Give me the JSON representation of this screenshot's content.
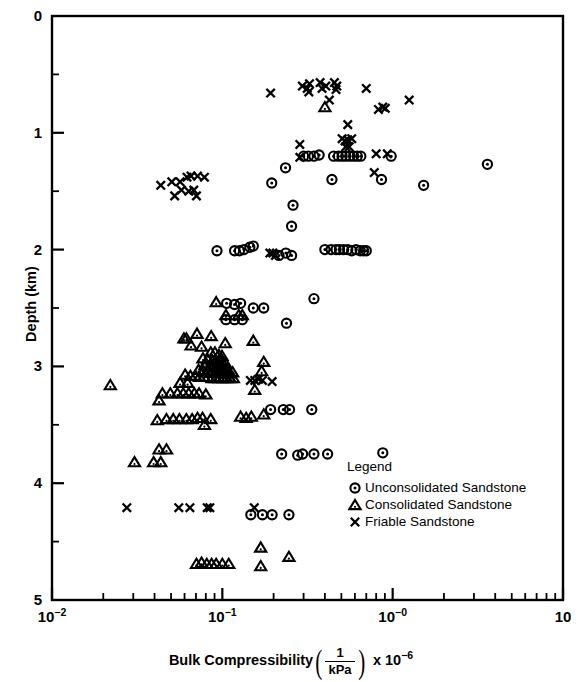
{
  "chart_data": {
    "type": "scatter",
    "title": "",
    "xlabel": "Bulk Compressibility (1/kPa) x 10^-6",
    "ylabel": "Depth (km)",
    "xscale": "log",
    "yscale": "linear",
    "xlim": [
      0.01,
      10
    ],
    "ylim": [
      0,
      5
    ],
    "y_inverted": true,
    "grid": false,
    "legend_position": "inside-lower-right",
    "x_tick_labels": [
      "10⁻²",
      "10⁻¹",
      "10⁻⁰",
      "10"
    ],
    "x_tick_values": [
      0.01,
      0.1,
      1,
      10
    ],
    "y_tick_labels": [
      "0",
      "1",
      "2",
      "3",
      "4",
      "5"
    ],
    "y_tick_values": [
      0,
      1,
      2,
      3,
      4,
      5
    ],
    "y_minor_ticks": [
      0.5,
      1.5,
      2.5,
      3.5,
      4.5
    ],
    "series": [
      {
        "name": "Unconsolidated Sandstone",
        "marker": "circle-dot",
        "points": [
          [
            0.3,
            1.2
          ],
          [
            0.32,
            1.2
          ],
          [
            0.345,
            1.2
          ],
          [
            0.37,
            1.19
          ],
          [
            0.45,
            1.2
          ],
          [
            0.48,
            1.2
          ],
          [
            0.505,
            1.2
          ],
          [
            0.53,
            1.2
          ],
          [
            0.56,
            1.2
          ],
          [
            0.59,
            1.2
          ],
          [
            0.62,
            1.2
          ],
          [
            0.65,
            1.2
          ],
          [
            0.98,
            1.2
          ],
          [
            3.6,
            1.27
          ],
          [
            1.52,
            1.45
          ],
          [
            0.235,
            1.3
          ],
          [
            0.195,
            1.43
          ],
          [
            0.44,
            1.4
          ],
          [
            0.86,
            1.4
          ],
          [
            0.26,
            1.62
          ],
          [
            0.255,
            1.8
          ],
          [
            0.093,
            2.01
          ],
          [
            0.118,
            2.01
          ],
          [
            0.126,
            2.01
          ],
          [
            0.134,
            2.0
          ],
          [
            0.145,
            1.98
          ],
          [
            0.152,
            1.97
          ],
          [
            0.215,
            2.05
          ],
          [
            0.236,
            2.03
          ],
          [
            0.255,
            2.05
          ],
          [
            0.4,
            2.0
          ],
          [
            0.435,
            2.0
          ],
          [
            0.465,
            2.0
          ],
          [
            0.487,
            2.0
          ],
          [
            0.515,
            2.0
          ],
          [
            0.545,
            2.0
          ],
          [
            0.575,
            2.01
          ],
          [
            0.61,
            2.0
          ],
          [
            0.645,
            2.01
          ],
          [
            0.675,
            2.01
          ],
          [
            0.7,
            2.01
          ],
          [
            0.106,
            2.46
          ],
          [
            0.118,
            2.47
          ],
          [
            0.128,
            2.46
          ],
          [
            0.152,
            2.5
          ],
          [
            0.175,
            2.5
          ],
          [
            0.345,
            2.42
          ],
          [
            0.105,
            2.6
          ],
          [
            0.118,
            2.6
          ],
          [
            0.131,
            2.6
          ],
          [
            0.238,
            2.63
          ],
          [
            0.192,
            3.37
          ],
          [
            0.228,
            3.37
          ],
          [
            0.248,
            3.37
          ],
          [
            0.335,
            3.37
          ],
          [
            0.223,
            3.75
          ],
          [
            0.277,
            3.76
          ],
          [
            0.296,
            3.75
          ],
          [
            0.345,
            3.75
          ],
          [
            0.415,
            3.75
          ],
          [
            0.875,
            3.74
          ],
          [
            0.147,
            4.27
          ],
          [
            0.172,
            4.27
          ],
          [
            0.196,
            4.27
          ],
          [
            0.246,
            4.27
          ]
        ]
      },
      {
        "name": "Consolidated Sandstone",
        "marker": "triangle",
        "points": [
          [
            0.4,
            0.78
          ],
          [
            0.092,
            2.45
          ],
          [
            0.105,
            2.56
          ],
          [
            0.125,
            2.56
          ],
          [
            0.131,
            2.56
          ],
          [
            0.0595,
            2.76
          ],
          [
            0.0615,
            2.76
          ],
          [
            0.071,
            2.72
          ],
          [
            0.086,
            2.74
          ],
          [
            0.0655,
            2.82
          ],
          [
            0.0755,
            2.83
          ],
          [
            0.104,
            2.8
          ],
          [
            0.152,
            2.78
          ],
          [
            0.17,
            3.04
          ],
          [
            0.175,
            2.96
          ],
          [
            0.0855,
            2.88
          ],
          [
            0.0905,
            2.88
          ],
          [
            0.0955,
            2.9
          ],
          [
            0.0995,
            2.91
          ],
          [
            0.077,
            2.93
          ],
          [
            0.082,
            2.94
          ],
          [
            0.0875,
            2.95
          ],
          [
            0.092,
            2.95
          ],
          [
            0.096,
            2.96
          ],
          [
            0.0995,
            2.96
          ],
          [
            0.104,
            2.97
          ],
          [
            0.079,
            2.99
          ],
          [
            0.0845,
            3.0
          ],
          [
            0.089,
            3.0
          ],
          [
            0.0935,
            3.01
          ],
          [
            0.0975,
            3.01
          ],
          [
            0.102,
            3.02
          ],
          [
            0.107,
            3.02
          ],
          [
            0.0725,
            3.03
          ],
          [
            0.0775,
            3.04
          ],
          [
            0.0825,
            3.04
          ],
          [
            0.0875,
            3.05
          ],
          [
            0.0915,
            3.05
          ],
          [
            0.0955,
            3.05
          ],
          [
            0.1,
            3.06
          ],
          [
            0.105,
            3.06
          ],
          [
            0.11,
            3.06
          ],
          [
            0.115,
            3.05
          ],
          [
            0.0605,
            3.07
          ],
          [
            0.065,
            3.08
          ],
          [
            0.0695,
            3.08
          ],
          [
            0.0735,
            3.09
          ],
          [
            0.078,
            3.09
          ],
          [
            0.0825,
            3.09
          ],
          [
            0.087,
            3.1
          ],
          [
            0.0915,
            3.1
          ],
          [
            0.096,
            3.1
          ],
          [
            0.101,
            3.1
          ],
          [
            0.106,
            3.1
          ],
          [
            0.111,
            3.1
          ],
          [
            0.116,
            3.1
          ],
          [
            0.022,
            3.16
          ],
          [
            0.0565,
            3.14
          ],
          [
            0.0625,
            3.14
          ],
          [
            0.0445,
            3.23
          ],
          [
            0.0495,
            3.23
          ],
          [
            0.0545,
            3.23
          ],
          [
            0.059,
            3.23
          ],
          [
            0.0635,
            3.23
          ],
          [
            0.0685,
            3.23
          ],
          [
            0.073,
            3.23
          ],
          [
            0.08,
            3.24
          ],
          [
            0.0425,
            3.29
          ],
          [
            0.155,
            3.2
          ],
          [
            0.175,
            3.41
          ],
          [
            0.0415,
            3.46
          ],
          [
            0.047,
            3.45
          ],
          [
            0.0515,
            3.45
          ],
          [
            0.056,
            3.45
          ],
          [
            0.0615,
            3.45
          ],
          [
            0.0665,
            3.45
          ],
          [
            0.0715,
            3.44
          ],
          [
            0.0765,
            3.44
          ],
          [
            0.0855,
            3.45
          ],
          [
            0.0785,
            3.5
          ],
          [
            0.128,
            3.43
          ],
          [
            0.138,
            3.44
          ],
          [
            0.148,
            3.43
          ],
          [
            0.0425,
            3.71
          ],
          [
            0.047,
            3.71
          ],
          [
            0.0305,
            3.82
          ],
          [
            0.0395,
            3.82
          ],
          [
            0.0435,
            3.82
          ],
          [
            0.0705,
            4.69
          ],
          [
            0.0755,
            4.68
          ],
          [
            0.081,
            4.69
          ],
          [
            0.0865,
            4.69
          ],
          [
            0.092,
            4.69
          ],
          [
            0.1,
            4.69
          ],
          [
            0.109,
            4.69
          ],
          [
            0.168,
            4.55
          ],
          [
            0.168,
            4.71
          ],
          [
            0.246,
            4.63
          ]
        ]
      },
      {
        "name": "Friable Sandstone",
        "marker": "cross",
        "points": [
          [
            0.192,
            0.66
          ],
          [
            0.295,
            0.6
          ],
          [
            0.315,
            0.62
          ],
          [
            0.325,
            0.58
          ],
          [
            0.322,
            0.65
          ],
          [
            0.375,
            0.57
          ],
          [
            0.385,
            0.62
          ],
          [
            0.405,
            0.6
          ],
          [
            0.455,
            0.57
          ],
          [
            0.465,
            0.63
          ],
          [
            0.47,
            0.6
          ],
          [
            0.7,
            0.62
          ],
          [
            0.425,
            0.72
          ],
          [
            0.825,
            0.8
          ],
          [
            0.875,
            0.78
          ],
          [
            0.905,
            0.79
          ],
          [
            1.25,
            0.72
          ],
          [
            0.545,
            0.93
          ],
          [
            0.505,
            1.05
          ],
          [
            0.525,
            1.07
          ],
          [
            0.545,
            1.06
          ],
          [
            0.575,
            1.05
          ],
          [
            0.53,
            1.12
          ],
          [
            0.555,
            1.12
          ],
          [
            0.8,
            1.18
          ],
          [
            0.93,
            1.18
          ],
          [
            0.285,
            1.1
          ],
          [
            0.285,
            1.21
          ],
          [
            0.78,
            1.34
          ],
          [
            0.0435,
            1.45
          ],
          [
            0.0505,
            1.42
          ],
          [
            0.0565,
            1.42
          ],
          [
            0.062,
            1.38
          ],
          [
            0.0655,
            1.37
          ],
          [
            0.0715,
            1.37
          ],
          [
            0.0785,
            1.38
          ],
          [
            0.0575,
            1.49
          ],
          [
            0.0635,
            1.5
          ],
          [
            0.068,
            1.49
          ],
          [
            0.0525,
            1.54
          ],
          [
            0.0705,
            1.54
          ],
          [
            0.19,
            2.03
          ],
          [
            0.198,
            2.03
          ],
          [
            0.205,
            2.05
          ],
          [
            0.146,
            3.12
          ],
          [
            0.155,
            3.12
          ],
          [
            0.163,
            3.11
          ],
          [
            0.172,
            3.12
          ],
          [
            0.196,
            3.13
          ],
          [
            0.0275,
            4.21
          ],
          [
            0.0555,
            4.21
          ],
          [
            0.0645,
            4.21
          ],
          [
            0.0815,
            4.21
          ],
          [
            0.0845,
            4.21
          ],
          [
            0.154,
            4.21
          ]
        ]
      }
    ]
  },
  "axes": {
    "x_title_prefix": "Bulk Compressibility",
    "x_title_frac_num": "1",
    "x_title_frac_den": "kPa",
    "x_title_mult": "x 10",
    "x_title_mult_exp": "−6",
    "y_title": "Depth (km)"
  },
  "legend": {
    "title": "Legend",
    "entries": [
      {
        "symbol": "circle-dot",
        "label": "Unconsolidated Sandstone"
      },
      {
        "symbol": "triangle",
        "label": "Consolidated Sandstone"
      },
      {
        "symbol": "cross",
        "label": "Friable Sandstone"
      }
    ]
  },
  "colors": {
    "ink": "#000000",
    "background": "#ffffff"
  }
}
